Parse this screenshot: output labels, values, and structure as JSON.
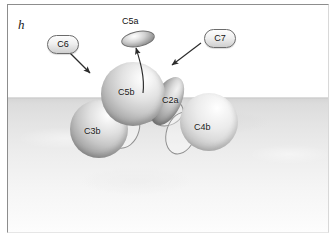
{
  "figure": {
    "panel_letter": "h",
    "caption_note": ""
  },
  "diagram": {
    "type": "schematic",
    "regions": [
      {
        "name": "extracellular",
        "label": "",
        "fill": "#ffffff"
      },
      {
        "name": "membrane",
        "label": "",
        "fill": "#dcdcdc"
      }
    ],
    "shapes": [
      {
        "id": "c5a",
        "label": "C5a",
        "form": "disc",
        "location": "above-membrane-free"
      },
      {
        "id": "c5b",
        "label": "C5b",
        "form": "sphere",
        "location": "membrane-bound"
      },
      {
        "id": "c3b",
        "label": "C3b",
        "form": "sphere",
        "location": "membrane-bound"
      },
      {
        "id": "c4b",
        "label": "C4b",
        "form": "sphere",
        "location": "membrane-bound"
      },
      {
        "id": "c2a",
        "label": "C2a",
        "form": "ellipsoid",
        "location": "membrane-bound"
      }
    ],
    "callouts": [
      {
        "id": "c6",
        "label": "C6",
        "points_to": "c5b",
        "direction": "down-right"
      },
      {
        "id": "c7",
        "label": "C7",
        "points_to": "c5b",
        "direction": "down-left"
      }
    ],
    "arrows": [
      {
        "id": "c5a-release",
        "from": "c5b",
        "to": "c5a",
        "style": "curved"
      },
      {
        "id": "c6-pointer",
        "from": "c6",
        "to": "c5b",
        "style": "straight"
      },
      {
        "id": "c7-pointer",
        "from": "c7",
        "to": "c5b",
        "style": "straight"
      }
    ],
    "colors": {
      "outline": "#6b6b6b",
      "membrane": "#dcdcdc",
      "background": "#ffffff",
      "text": "#111111"
    }
  }
}
